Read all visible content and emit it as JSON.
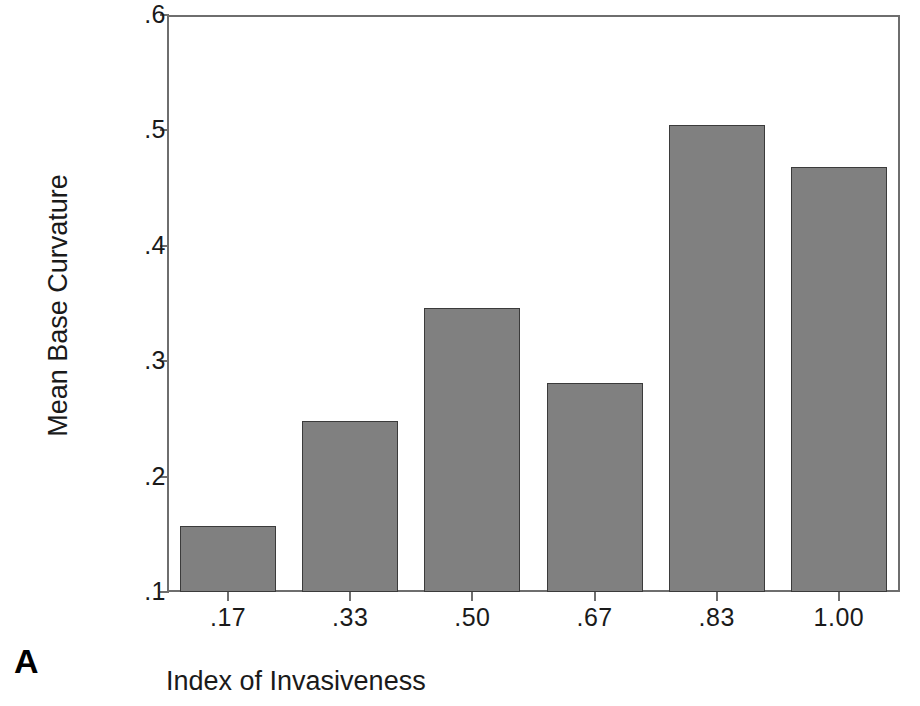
{
  "panel": {
    "label": "A"
  },
  "chart_data": {
    "type": "bar",
    "title": "",
    "xlabel": "Index of Invasiveness",
    "ylabel": "Mean Base Curvature",
    "categories": [
      ".17",
      ".33",
      ".50",
      ".67",
      ".83",
      "1.00"
    ],
    "values": [
      0.157,
      0.248,
      0.346,
      0.281,
      0.505,
      0.468
    ],
    "ylim": [
      0.1,
      0.6
    ],
    "yticks": [
      0.1,
      0.2,
      0.3,
      0.4,
      0.5,
      0.6
    ],
    "ytick_labels": [
      ".1",
      ".2",
      ".3",
      ".4",
      ".5",
      ".6"
    ],
    "grid": false,
    "legend": null,
    "bar_color": "#808080",
    "bar_edge_color": "#3b3b3b",
    "axis_color": "#6e6e6e"
  }
}
